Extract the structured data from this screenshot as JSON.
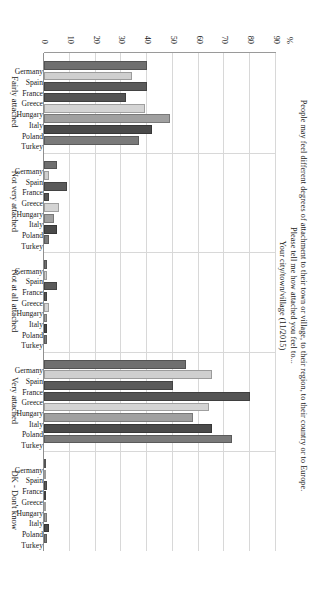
{
  "chart_data": {
    "type": "bar",
    "title_lines": [
      "People may feel different degrees of attachment to their town or village, to their region, to their country or to Europe.",
      "Please tell me how attached you feel to...",
      "Your city/town/village (11/2015)"
    ],
    "orientation": "vertical-bars-grouped",
    "ylabel": "%",
    "ylim": [
      0,
      90
    ],
    "yticks": [
      0,
      10,
      20,
      30,
      40,
      50,
      60,
      70,
      80,
      90
    ],
    "grid": true,
    "legend": "none",
    "categories": [
      "Germany",
      "Spain",
      "France",
      "Greece",
      "Hungary",
      "Italy",
      "Poland",
      "Turkey"
    ],
    "groups": [
      {
        "label": "Fairly attached",
        "values": [
          40,
          34,
          40,
          32,
          39,
          49,
          42,
          37
        ]
      },
      {
        "label": "Not very attached",
        "values": [
          5,
          2,
          9,
          2,
          6,
          4,
          5,
          2
        ]
      },
      {
        "label": "Not at all attached",
        "values": [
          1,
          1,
          5,
          1,
          2,
          1,
          1,
          1
        ]
      },
      {
        "label": "Very attached",
        "values": [
          55,
          65,
          50,
          80,
          64,
          58,
          65,
          73
        ]
      },
      {
        "label": "DK - Don't know",
        "values": [
          0,
          0,
          1,
          0,
          0,
          1,
          2,
          1
        ]
      }
    ],
    "series_colors": {
      "Germany": "#6f6f6f",
      "Spain": "#cfcfcf",
      "France": "#5a5a5a",
      "Greece": "#545454",
      "Hungary": "#d4d4d4",
      "Italy": "#a0a0a0",
      "Poland": "#4a4a4a",
      "Turkey": "#7a7a7a"
    },
    "axis_color": "#8f8f8f",
    "grid_color": "#d8d8d8"
  }
}
